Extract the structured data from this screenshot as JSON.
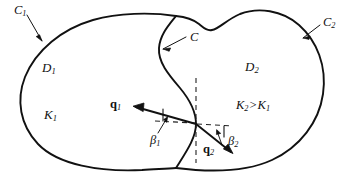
{
  "figure": {
    "type": "technical-diagram",
    "stroke_color": "#111111",
    "background_color": "#ffffff",
    "dash_color": "#222222",
    "width": 350,
    "height": 187
  },
  "labels": {
    "outer_boundary_left": {
      "base": "C",
      "sub": "1"
    },
    "outer_boundary_right": {
      "base": "C",
      "sub": "2"
    },
    "interface_curve": {
      "base": "C",
      "sub": ""
    },
    "domain_left": {
      "base": "D",
      "sub": "1"
    },
    "domain_right": {
      "base": "D",
      "sub": "2"
    },
    "conductivity_left": {
      "base": "K",
      "sub": "1"
    },
    "flux_left": {
      "base": "q",
      "sub": "1"
    },
    "flux_right": {
      "base": "q",
      "sub": "2"
    },
    "angle_left": {
      "base": "β",
      "sub": "1"
    },
    "angle_right": {
      "base": "β",
      "sub": "2"
    }
  },
  "inequality": {
    "left_term": "K",
    "left_sub": "2",
    "operator": ">",
    "right_term": "K",
    "right_sub": "1"
  },
  "icons": {
    "arrow_to_c1": "arrow-icon",
    "arrow_to_c2": "arrow-icon",
    "arrow_to_c": "arrow-icon",
    "flux_vector_1": "vector-arrow-icon",
    "flux_vector_2": "vector-arrow-icon",
    "angle_arc_1": "angle-arc-icon",
    "angle_arc_2": "angle-arc-icon"
  }
}
